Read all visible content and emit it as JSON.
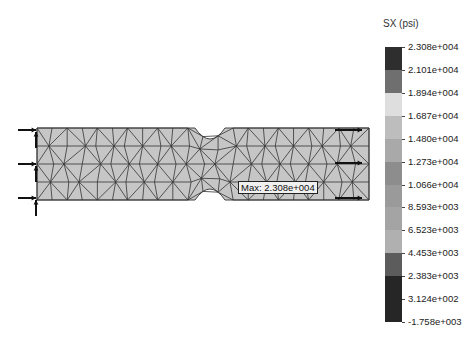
{
  "plot": {
    "result_type": "SX (psi)",
    "body_fill": "#c6c6c6",
    "mesh_color": "#333333",
    "max_annotation": "Max: 2.308e+004",
    "fixtures_side": "left",
    "loads_side": "right",
    "fixture_count": 3,
    "load_count": 3
  },
  "legend": {
    "title": "SX (psi)",
    "labels": [
      "2.308e+004",
      "2.101e+004",
      "1.894e+004",
      "1.687e+004",
      "1.480e+004",
      "1.273e+004",
      "1.066e+004",
      "8.593e+003",
      "6.523e+003",
      "4.453e+003",
      "2.383e+003",
      "3.124e+002",
      "-1.758e+003"
    ],
    "band_colors": [
      "#2e2e2e",
      "#6f6f6f",
      "#dedede",
      "#bdbdbd",
      "#a9a9a9",
      "#8d8d8d",
      "#9a9a9a",
      "#a4a4a4",
      "#b0b0b0",
      "#5c5c5c",
      "#262626",
      "#262626"
    ]
  }
}
